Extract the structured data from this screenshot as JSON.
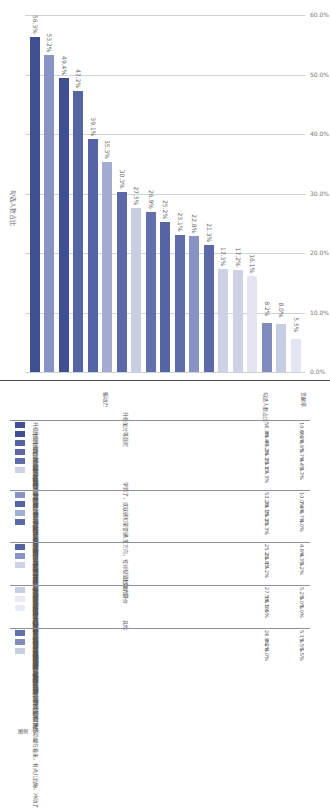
{
  "chart_data": {
    "type": "bar",
    "orientation": "vertical (page rotated 90°)",
    "title": "",
    "xlabel": "",
    "ylabel": "勾选人数占比",
    "ylim": [
      0,
      60
    ],
    "yticks": [
      "0.0%",
      "10.0%",
      "20.0%",
      "30.0%",
      "40.0%",
      "50.0%",
      "60.0%"
    ],
    "grid": true,
    "categories": [
      "升级加分：综合测试加分，提升排名",
      "学到了：原来有这么多要学的，不亲手做都不知之前的我有多无知",
      "升级加分：大创过程出成果比论文、专利，加分深造都有用",
      "升级加分：保研加分",
      "成就感：我竟然做到了我以为自己永远不可能做到的事，能力拉满，爽",
      "学到了：原来高人是这样做人做事儿的，不跟他一起做，真的不知道，赞",
      "提分升级：考研复试刷印象",
      "社交价值：能深交几个朋友，期待革命友谊",
      "从众行为：大家都去我也要去，不然落单，尬",
      "人生方向：我有热爱参与这样有价值的事儿，人生不再迷茫焦虑，明白了",
      "接触牛人课题组：和硕士导师提前接触增加了解和背景",
      "校园标准：跟未来毅多，学校和老师们觉得他哪里这个",
      "荣誉感：人生第一个国家课题，光荣",
      "说评晋级：求职刷印象，“卖”个好价钱",
      "能力评价：虽然我能出力，但难说别人还不知道，老师给了个高分，证明我还可以",
      "魅力加分：成为别人眼中的大牛，光环上身，爽",
      "社交价值：既能获得异性青睐又能交朋友，期待爱情",
      "经济价值：钱，满眼经费",
      "冲动行为：被当年老师学长鼓动了热情，现在看来，有点儿后悔，冲动了"
    ],
    "values": [
      56.3,
      53.2,
      49.4,
      47.2,
      39.1,
      35.3,
      30.3,
      27.5,
      26.9,
      25.2,
      23.1,
      22.8,
      21.3,
      17.3,
      17.2,
      16.1,
      5.5,
      8.2,
      8.0
    ],
    "bar_order_values": [
      56.3,
      53.2,
      49.4,
      47.2,
      39.1,
      35.3,
      30.3,
      27.5,
      26.9,
      25.2,
      23.1,
      22.8,
      21.3,
      17.3,
      17.2,
      16.1,
      8.2,
      8.0,
      5.5
    ],
    "bar_order_labels": [
      "56.3%",
      "53.2%",
      "49.4%",
      "47.2%",
      "39.1%",
      "35.3%",
      "30.3%",
      "27.5%",
      "26.9%",
      "25.2%",
      "23.1%",
      "22.8%",
      "21.3%",
      "17.3%",
      "17.2%",
      "16.1%",
      "8.2%",
      "8.0%",
      "5.5%"
    ],
    "bar_order_colors": [
      "#3f4f8f",
      "#8693c3",
      "#3f4f8f",
      "#5565a3",
      "#5565a3",
      "#a3adcf",
      "#5b6aa6",
      "#c7cde3",
      "#6070ad",
      "#5565a3",
      "#5e6da9",
      "#8693c3",
      "#5b6aa6",
      "#cdd2e6",
      "#cdd2e6",
      "#ffffff",
      "#7f8cbd",
      "#c7cde3",
      "#ffffff"
    ]
  },
  "axis": {
    "title": "勾选人数占比",
    "ticks": [
      "0.0%",
      "10.0%",
      "20.0%",
      "30.0%",
      "40.0%",
      "50.0%",
      "60.0%"
    ]
  },
  "table": {
    "headers": {
      "legend": "图例",
      "driver": "驱动力",
      "share": "勾选人数占比",
      "weight": "贡献率"
    },
    "groups": [
      {
        "title": "升级加分等目的",
        "rows": [
          {
            "color": "#3f4f8f",
            "label": "升级加分：综合测试加分，提升排名",
            "share": "56.3%",
            "weight": "10.6%"
          },
          {
            "color": "#3f4f8f",
            "label": "升级加分：大创过程出成果比论文、专利，加分深造都有用",
            "share": "49.4%",
            "weight": "9.3%"
          },
          {
            "color": "#5565a3",
            "label": "升级加分：保研加分",
            "share": "47.2%",
            "weight": "8.9%"
          },
          {
            "color": "#5b6aa6",
            "label": "提分升级：考研复试刷印象",
            "share": "30.3%",
            "weight": "5.7%"
          },
          {
            "color": "#5e6da9",
            "label": "接触牛人课题组：和硕士导师提前接触增加了解和背景",
            "share": "23.1%",
            "weight": "4.4%"
          },
          {
            "color": "#cdd2e6",
            "label": "说评晋级：求职刷印象，“卖”个好价钱",
            "share": "17.3%",
            "weight": "3.3%"
          }
        ]
      },
      {
        "title": "学到了，成就感和荣誉感",
        "rows": [
          {
            "color": "#8693c3",
            "label": "学到了：原来有这么多要学的，不亲手做都不知之前的我有多无知",
            "share": "53.2%",
            "weight": "10.0%"
          },
          {
            "color": "#5565a3",
            "label": "成就感：我竟然做到了我以为自己永远不可能做到的事，能力拉满，爽",
            "share": "39.1%",
            "weight": "7.4%"
          },
          {
            "color": "#a3adcf",
            "label": "学到了：原来高人是这样做人做事儿的，不跟他一起做，真的不知道，赞",
            "share": "35.3%",
            "weight": "6.7%"
          },
          {
            "color": "#5b6aa6",
            "label": "荣誉感：人生第一个国家课题，光荣",
            "share": "21.3%",
            "weight": "4.0%"
          }
        ]
      },
      {
        "title": "人生方向，校对规范和能力评价",
        "rows": [
          {
            "color": "#5565a3",
            "label": "人生方向：我有热爱参与这样有价值的事儿，人生不再迷茫焦虑，明白了",
            "share": "25.2%",
            "weight": "4.8%"
          },
          {
            "color": "#8693c3",
            "label": "校对标准：跟未来毅多，学校和老师们觉得他哪里这个",
            "share": "22.8%",
            "weight": "4.3%"
          },
          {
            "color": "#cdd2e6",
            "label": "能力评价：虽然我能出力，但难说别人还不知道，老师给了个高分，证明我还可以",
            "share": "17.2%",
            "weight": "3.2%"
          }
        ]
      },
      {
        "title": "社交价值",
        "rows": [
          {
            "color": "#c7cde3",
            "label": "社交价值：能深交几个朋友，期待革命友谊",
            "share": "27.5%",
            "weight": "5.2%"
          },
          {
            "color": "#ffffff",
            "label": "魅力加分：成为别人眼中的大牛，光环上身，爽",
            "share": "16.1%",
            "weight": "3.0%"
          },
          {
            "color": "#ffffff",
            "label": "社交价值：既能获得异性青睐又能交朋友，期待爱情",
            "share": "5.5%",
            "weight": "1.0%"
          }
        ]
      },
      {
        "title": "其他",
        "rows": [
          {
            "color": "#6070ad",
            "label": "从众行为：大家都去我也要去，不然落单，尬",
            "share": "26.9%",
            "weight": "5.1%"
          },
          {
            "color": "#7f8cbd",
            "label": "经济价值：钱，满眼经费",
            "share": "8.2%",
            "weight": "1.5%"
          },
          {
            "color": "#c7cde3",
            "label": "冲动行为：被当年老师学长鼓动了热情，现在看来，有点儿后悔，冲动了",
            "share": "8.0%",
            "weight": "1.5%"
          }
        ]
      }
    ]
  }
}
